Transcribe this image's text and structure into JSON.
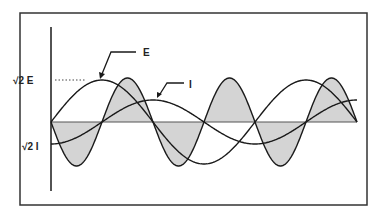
{
  "diagram": {
    "labels": {
      "e_peak": "√2 E",
      "i_peak": "√2 I",
      "e_curve": "E",
      "i_curve": "I"
    },
    "colors": {
      "line": "#1a1a1a",
      "shade": "#d4d4d4",
      "frame": "#333333"
    },
    "geometry": {
      "frame": {
        "x": 20,
        "y": 13,
        "w": 347,
        "h": 192
      },
      "axis": {
        "x": 51,
        "y_top": 27,
        "y_bottom": 191
      },
      "zero_y": 122,
      "x_start": 51,
      "x_end": 357
    },
    "waves": {
      "voltage_E": {
        "name": "E",
        "amplitude": 42,
        "period": 204,
        "phase": "sine"
      },
      "current_I": {
        "name": "I",
        "amplitude": 22,
        "period": 204,
        "phase": "negative-cosine"
      },
      "power": {
        "name": "power (E×I)",
        "amplitude": 44,
        "period": 102,
        "shaded": true
      }
    }
  }
}
